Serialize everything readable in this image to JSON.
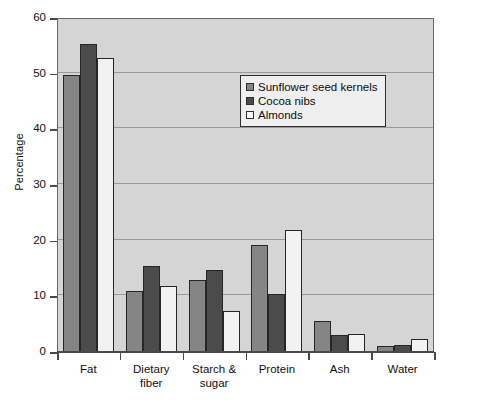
{
  "chart_data": {
    "type": "bar",
    "title": "",
    "subtitle": "",
    "xlabel": "",
    "ylabel": "Percentage",
    "ylim": [
      0,
      60
    ],
    "yticks": [
      0,
      10,
      20,
      30,
      40,
      50,
      60
    ],
    "ytick_labels": [
      "0",
      "10",
      "20",
      "30",
      "40",
      "50",
      "60"
    ],
    "grid": true,
    "grid_axis": "y",
    "legend_position": "upper center",
    "categories": [
      "Fat",
      "Dietary fiber",
      "Starch & sugar",
      "Protein",
      "Ash",
      "Water"
    ],
    "category_lines": [
      [
        "Fat"
      ],
      [
        "Dietary",
        "fiber"
      ],
      [
        "Starch &",
        "sugar"
      ],
      [
        "Protein"
      ],
      [
        "Ash"
      ],
      [
        "Water"
      ]
    ],
    "series": [
      {
        "name": "Sunflower seed kernels",
        "color": "#858585",
        "values": [
          49.8,
          11.0,
          13.0,
          19.2,
          5.5,
          1.1
        ]
      },
      {
        "name": "Cocoa nibs",
        "color": "#4b4b4b",
        "values": [
          55.3,
          15.4,
          14.7,
          10.4,
          3.0,
          1.3
        ]
      },
      {
        "name": "Almonds",
        "color": "#f2f2f2",
        "values": [
          52.8,
          11.8,
          7.3,
          21.9,
          3.2,
          2.4
        ]
      }
    ]
  },
  "style": {
    "plot_background": "#d5d5d5",
    "page_background": "#ffffff",
    "axis_color": "#4a4a4a",
    "gridline_color": "#9a9a9a",
    "bar_edge_color": "#262626",
    "legend_background": "#efefef",
    "legend_border": "#2e2e2e"
  }
}
